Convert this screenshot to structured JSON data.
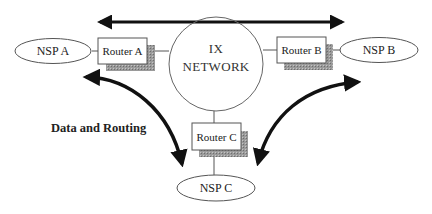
{
  "diagram": {
    "hub": {
      "label_line1": "IX",
      "label_line2": "NETWORK"
    },
    "routers": [
      {
        "id": "router-a",
        "label": "Router A"
      },
      {
        "id": "router-b",
        "label": "Router B"
      },
      {
        "id": "router-c",
        "label": "Router C"
      }
    ],
    "nsps": [
      {
        "id": "nsp-a",
        "label": "NSP A"
      },
      {
        "id": "nsp-b",
        "label": "NSP B"
      },
      {
        "id": "nsp-c",
        "label": "NSP C"
      }
    ],
    "caption": "Data and Routing",
    "colors": {
      "stroke": "#555555",
      "arrow": "#111111",
      "shadow": "#8a8a8a",
      "background": "#ffffff"
    }
  }
}
